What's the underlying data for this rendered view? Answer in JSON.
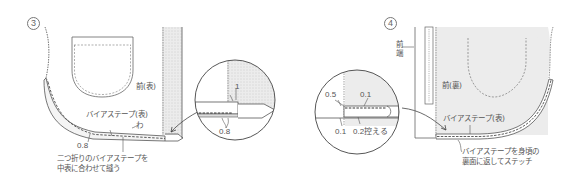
{
  "step3": {
    "number": "3",
    "labels": {
      "front_right_side": "前(表)",
      "bias_tape": "バイアステープ(表)",
      "fold": "わ",
      "seam_allowance": "0.8",
      "instruction_line1": "二つ折りのバイアステープを",
      "instruction_line2": "中表に合わせて縫う"
    },
    "detail_circle": {
      "dimension_top": "1",
      "dimension_bottom": "0.8"
    }
  },
  "step4": {
    "number": "4",
    "labels": {
      "front_edge": "前端",
      "front_wrong_side": "前(裏)",
      "bias_tape": "バイアステープ(表)",
      "instruction_line1": "バイアステープを身頃の",
      "instruction_line2": "裏面に返してステッチ"
    },
    "detail_circle": {
      "dim_top_left": "0.5",
      "dim_top_right": "0.1",
      "dim_bottom_left": "0.1",
      "dim_bottom_right": "0.2控える"
    }
  },
  "colors": {
    "line": "#555555",
    "fabric_fill": "#e9e9e9",
    "background": "#ffffff"
  }
}
